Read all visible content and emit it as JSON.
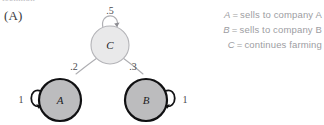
{
  "figure": {
    "panel_label": "(A)",
    "top_cut_text": "tecnmon"
  },
  "graph": {
    "nodes": [
      {
        "id": "C",
        "label": "C",
        "cx": 110,
        "cy": 45,
        "r": 19,
        "fill": "#e9e9ea",
        "stroke": "#b4b4b8",
        "stroke_width": 1.1
      },
      {
        "id": "A",
        "label": "A",
        "cx": 60,
        "cy": 100,
        "r": 21,
        "fill": "#bcbcbe",
        "stroke": "#101012",
        "stroke_width": 2.2
      },
      {
        "id": "B",
        "label": "B",
        "cx": 146,
        "cy": 100,
        "r": 21,
        "fill": "#bcbcbe",
        "stroke": "#101012",
        "stroke_width": 2.2
      }
    ],
    "edges": [
      {
        "from": "C",
        "to": "A",
        "weight": ".2",
        "label_x": 74,
        "label_y": 67
      },
      {
        "from": "C",
        "to": "B",
        "weight": ".3",
        "label_x": 132,
        "label_y": 67
      }
    ],
    "self_loops": [
      {
        "node": "C",
        "weight": ".5",
        "position": "top",
        "label_x": 110,
        "label_y": 11
      },
      {
        "node": "A",
        "weight": "1",
        "position": "left",
        "label_x": 24,
        "label_y": 103
      },
      {
        "node": "B",
        "weight": "1",
        "position": "right",
        "label_x": 183,
        "label_y": 103
      }
    ]
  },
  "legend": {
    "rows": [
      {
        "symbol": "A",
        "equals": "=",
        "description": "sells to company A"
      },
      {
        "symbol": "B",
        "equals": "=",
        "description": "sells to company B"
      },
      {
        "symbol": "C",
        "equals": "=",
        "description": "continues farming"
      }
    ]
  }
}
